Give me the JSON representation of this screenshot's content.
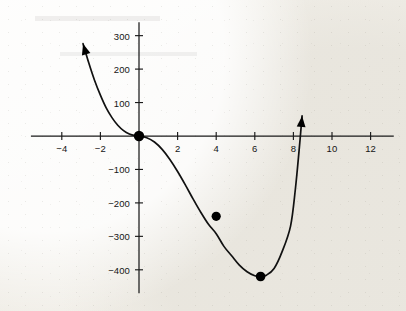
{
  "figure": {
    "kind": "hand-drawn-cartesian-graph",
    "background": "#f3f1ec",
    "ink_color": "#111111"
  },
  "chart_data": {
    "type": "line",
    "title": "",
    "subtitle": "",
    "xlabel": "",
    "ylabel": "",
    "xlim": [
      -5.6,
      13.2
    ],
    "ylim": [
      -470,
      340
    ],
    "grid": false,
    "legend": null,
    "axes": {
      "x_ticks": [
        -4,
        -2,
        2,
        4,
        6,
        8,
        10,
        12
      ],
      "x_tick_labels": [
        "-4",
        "-2",
        "2",
        "4",
        "6",
        "8",
        "10",
        "12"
      ],
      "y_ticks": [
        300,
        200,
        100,
        -100,
        -200,
        -300,
        -400
      ],
      "y_tick_labels": [
        "300",
        "200",
        "100",
        "-100",
        "-200",
        "-300",
        "-400"
      ],
      "origin_label_shown": false,
      "x_axis_arrowheads": false,
      "y_axis_arrowheads": false
    },
    "series": [
      {
        "name": "curve",
        "description": "cubic with double root at x = 0 and single root near x = 7.85",
        "arrowhead_start": true,
        "arrowhead_end": true,
        "x": [
          -2.9,
          -2.6,
          -2.3,
          -2.0,
          -1.7,
          -1.4,
          -1.1,
          -0.8,
          -0.5,
          -0.2,
          0.0,
          0.4,
          0.8,
          1.2,
          1.6,
          2.0,
          2.4,
          2.8,
          3.2,
          3.6,
          4.0,
          4.4,
          4.8,
          5.2,
          5.6,
          6.0,
          6.3,
          6.6,
          7.0,
          7.4,
          7.85,
          8.1,
          8.3,
          8.45
        ],
        "y": [
          276,
          218,
          166,
          122,
          84,
          55,
          32,
          16,
          6,
          1,
          0,
          -5,
          -18,
          -40,
          -70,
          -106,
          -146,
          -188,
          -228,
          -264,
          -292,
          -330,
          -358,
          -386,
          -406,
          -418,
          -420,
          -416,
          -396,
          -348,
          -270,
          -160,
          -40,
          60
        ]
      }
    ],
    "points": [
      {
        "label": "origin",
        "x": 0,
        "y": 0,
        "marker": "filled-circle",
        "size": 5.2
      },
      {
        "label": "point-on-curve",
        "x": 4.0,
        "y": -240,
        "marker": "filled-circle",
        "size": 4.6
      },
      {
        "label": "minimum",
        "x": 6.3,
        "y": -420,
        "marker": "filled-circle",
        "size": 4.8
      }
    ],
    "annotations": []
  }
}
